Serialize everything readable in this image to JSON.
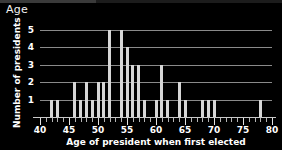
{
  "window": {
    "title": "Age"
  },
  "chart_data": {
    "type": "bar",
    "title": "",
    "xlabel": "Age of president when first elected",
    "ylabel": "Number of presidents",
    "xlim": [
      40,
      80
    ],
    "ylim": [
      0,
      5
    ],
    "grid": true,
    "legend": "none",
    "x_ticks_major": [
      40,
      45,
      50,
      55,
      60,
      65,
      70,
      75,
      80
    ],
    "x_tick_labels": [
      "40",
      "45",
      "50",
      "55",
      "60",
      "65",
      "70",
      "75",
      "80"
    ],
    "x_tick_minor_step": 1,
    "y_ticks": [
      1,
      2,
      3,
      4,
      5
    ],
    "y_tick_labels": [
      "1",
      "2",
      "3",
      "4",
      "5"
    ],
    "categories": [
      42,
      43,
      46,
      47,
      48,
      49,
      50,
      51,
      52,
      54,
      55,
      56,
      57,
      58,
      60,
      61,
      62,
      64,
      65,
      68,
      69,
      70,
      78
    ],
    "values": [
      1,
      1,
      2,
      1,
      2,
      1,
      2,
      2,
      5,
      5,
      4,
      3,
      3,
      1,
      1,
      3,
      1,
      2,
      1,
      1,
      1,
      1,
      1
    ]
  }
}
